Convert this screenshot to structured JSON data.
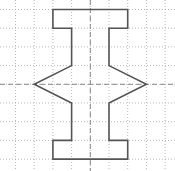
{
  "diagram": {
    "type": "grid-figure-with-symmetry-axes",
    "grid": {
      "origin_x": 15.5,
      "origin_y": 9.5,
      "cell": 18.7,
      "columns": 9,
      "rows": 9,
      "line_color": "#a8a8a8",
      "style": "dotted"
    },
    "axes": [
      {
        "name": "vertical-symmetry-axis",
        "orientation": "vertical",
        "col": 4,
        "color": "#8a8a8a",
        "style": "dashed"
      },
      {
        "name": "horizontal-symmetry-axis",
        "orientation": "horizontal",
        "row": 4,
        "color": "#8a8a8a",
        "style": "dashed"
      }
    ],
    "shape": {
      "name": "spool-shaped-polygon",
      "stroke": "#555555",
      "stroke_width": 1.6,
      "vertices": [
        [
          2,
          0
        ],
        [
          6,
          0
        ],
        [
          6,
          1
        ],
        [
          5,
          1
        ],
        [
          5,
          3
        ],
        [
          7,
          4
        ],
        [
          5,
          5
        ],
        [
          5,
          7
        ],
        [
          6,
          7
        ],
        [
          6,
          8
        ],
        [
          2,
          8
        ],
        [
          2,
          7
        ],
        [
          3,
          7
        ],
        [
          3,
          5
        ],
        [
          1,
          4
        ],
        [
          3,
          3
        ],
        [
          3,
          1
        ],
        [
          2,
          1
        ]
      ]
    }
  }
}
